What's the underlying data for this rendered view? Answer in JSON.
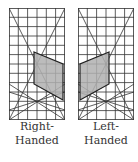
{
  "figure": {
    "panels": [
      {
        "id": "right-handed",
        "label_line1": "Right-",
        "label_line2": "Handed",
        "grid": {
          "cols": 6,
          "rows": 12
        },
        "shaded_polygon": "quadrilateral shaded gray, right side of grid"
      },
      {
        "id": "left-handed",
        "label_line1": "Left-",
        "label_line2": "Handed",
        "grid": {
          "cols": 6,
          "rows": 12
        },
        "shaded_polygon": "quadrilateral shaded gray, left side of grid (mirror image)"
      }
    ],
    "colors": {
      "grid_line": "#333333",
      "shade_fill": "#b0b0b0",
      "shade_stroke": "#222222"
    }
  }
}
